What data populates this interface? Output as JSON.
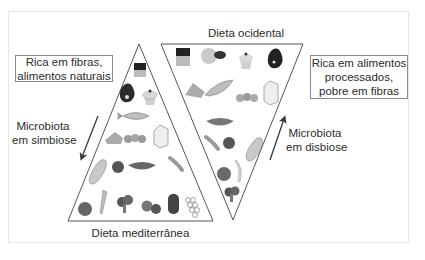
{
  "figure": {
    "left_pyramid": {
      "title": "Dieta mediterrânea",
      "orientation": "upright",
      "description_box": [
        "Rica em fibras,",
        "alimentos naturais"
      ],
      "arrow": {
        "direction": "down",
        "label": [
          "Microbiota",
          "em simbiose"
        ]
      },
      "food_rows": [
        [
          "chocolate"
        ],
        [
          "red-meat",
          "cupcake"
        ],
        [
          "fish"
        ],
        [
          "cheese",
          "eggs",
          "milk-carton"
        ],
        [
          "bread",
          "walnut",
          "bowl",
          "peas"
        ],
        [
          "apple",
          "carrot",
          "broccoli",
          "tomatoes",
          "pepper",
          "grapes"
        ]
      ]
    },
    "right_pyramid": {
      "title": "Dieta ocidental",
      "orientation": "inverted",
      "description_box": [
        "Rica em alimentos",
        "processados,",
        "pobre em fibras"
      ],
      "arrow": {
        "direction": "up",
        "label": [
          "Microbiota",
          "em disbiose"
        ]
      },
      "food_rows": [
        [
          "chocolate",
          "donuts",
          "cupcake",
          "red-meat"
        ],
        [
          "cheese",
          "fish",
          "eggs",
          "milk-carton"
        ],
        [
          "bowl"
        ],
        [
          "peas",
          "walnut",
          "bread"
        ],
        [
          "apple",
          "banana"
        ],
        [
          "broccoli"
        ]
      ]
    },
    "colors": {
      "line": "#555555",
      "box_border": "#8a8a8a",
      "frame_border": "#e6e6e6",
      "text": "#2b2b2b"
    }
  }
}
